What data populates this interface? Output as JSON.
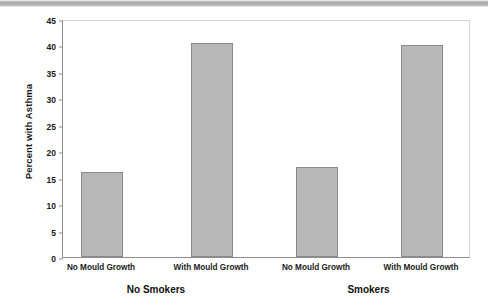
{
  "chart_data": {
    "type": "bar",
    "title": "",
    "xlabel": "",
    "ylabel": "Percent with Asthma",
    "ylim": [
      0,
      45
    ],
    "yticks": [
      0,
      5,
      10,
      15,
      20,
      25,
      30,
      35,
      40,
      45
    ],
    "grid": false,
    "legend": null,
    "categories": [
      "No Mould Growth",
      "With Mould Growth",
      "No Mould Growth",
      "With Mould Growth"
    ],
    "values": [
      16,
      40.5,
      17,
      40
    ],
    "groups": [
      {
        "label": "No Smokers",
        "categories": [
          "No Mould Growth",
          "With Mould Growth"
        ],
        "values": [
          16,
          40.5
        ]
      },
      {
        "label": "Smokers",
        "categories": [
          "No Mould Growth",
          "With Mould Growth"
        ],
        "values": [
          17,
          40
        ]
      }
    ],
    "bar_color": "#b8b8b8",
    "bar_edge_color": "#8a8a8a",
    "axis_color": "#8d8d8d",
    "text_color": "#1a1a1a"
  }
}
